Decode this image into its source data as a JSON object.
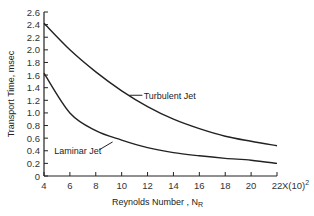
{
  "chart_data": {
    "type": "line",
    "title": "",
    "xlabel": "Reynolds Number , N_R",
    "xlabel_main": "Reynolds Number , N",
    "xlabel_sub": "R",
    "ylabel": "Transport Time, msec",
    "x_multiplier": "X(10)",
    "x_multiplier_exp": "2",
    "xlim": [
      4,
      22
    ],
    "ylim": [
      0,
      2.6
    ],
    "grid": false,
    "x": [
      4,
      6,
      8,
      10,
      12,
      14,
      16,
      18,
      20,
      22
    ],
    "xticks": [
      "4",
      "6",
      "8",
      "10",
      "12",
      "14",
      "16",
      "18",
      "20",
      "22"
    ],
    "yticks": [
      "0",
      "0.2",
      "0.4",
      "0.6",
      "0.8",
      "1.0",
      "1.2",
      "1.4",
      "1.6",
      "1.8",
      "2.0",
      "2.2",
      "2.4",
      "2.6"
    ],
    "series": [
      {
        "name": "Turbulent Jet",
        "values": [
          2.42,
          2.0,
          1.65,
          1.35,
          1.1,
          0.9,
          0.75,
          0.63,
          0.55,
          0.48
        ]
      },
      {
        "name": "Laminar Jet",
        "values": [
          1.63,
          1.0,
          0.72,
          0.57,
          0.45,
          0.37,
          0.32,
          0.28,
          0.25,
          0.2
        ]
      }
    ],
    "annotations": [
      {
        "text": "Turbulent Jet",
        "series": 0
      },
      {
        "text": "Laminar Jet",
        "series": 1
      }
    ]
  }
}
